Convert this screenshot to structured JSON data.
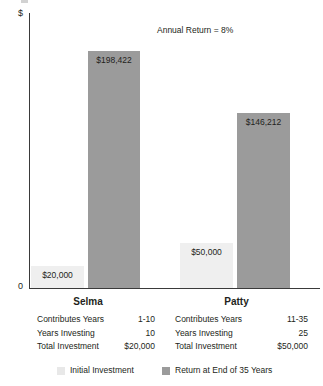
{
  "chart_data": {
    "type": "bar",
    "title": "",
    "annotation": "Annual Return = 8%",
    "xlabel": "",
    "ylabel": "$",
    "axis_top_label": "$",
    "axis_zero_label": "0",
    "grid": false,
    "legend_position": "bottom",
    "categories": [
      "Selma",
      "Patty"
    ],
    "series": [
      {
        "name": "Initial Investment",
        "color": "#efefef",
        "values": [
          20000,
          50000
        ],
        "value_labels": [
          "$20,000",
          "$50,000"
        ]
      },
      {
        "name": "Return at End of 35 Years",
        "color": "#9b9b9b",
        "values": [
          198422,
          146212
        ],
        "value_labels": [
          "$198,422",
          "$146,212"
        ]
      }
    ],
    "ylim": [
      0,
      215000
    ]
  },
  "groups": [
    {
      "name": "Selma",
      "initial_label": "$20,000",
      "return_label": "$198,422",
      "rows": [
        {
          "label": "Contributes Years",
          "value": "1-10"
        },
        {
          "label": "Years Investing",
          "value": "10"
        },
        {
          "label": "Total Investment",
          "value": "$20,000"
        }
      ]
    },
    {
      "name": "Patty",
      "initial_label": "$50,000",
      "return_label": "$146,212",
      "rows": [
        {
          "label": "Contributes Years",
          "value": "11-35"
        },
        {
          "label": "Years Investing",
          "value": "25"
        },
        {
          "label": "Total Investment",
          "value": "$50,000"
        }
      ]
    }
  ],
  "legend": {
    "items": [
      {
        "label": "Initial Investment",
        "color": "#e8e8e8"
      },
      {
        "label": "Return at End of 35 Years",
        "color": "#9b9b9b"
      }
    ]
  }
}
